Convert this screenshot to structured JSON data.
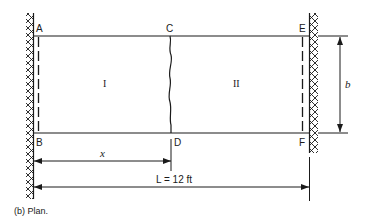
{
  "diagram": {
    "caption": "(b) Plan.",
    "points": {
      "A": "A",
      "B": "B",
      "C": "C",
      "D": "D",
      "E": "E",
      "F": "F"
    },
    "regions": {
      "region_1": "I",
      "region_2": "II"
    },
    "dimensions": {
      "x_label": "x",
      "b_label": "b",
      "L_label": "L = 12 ft"
    },
    "colors": {
      "line": "#1a1a1a",
      "background": "#ffffff"
    }
  }
}
